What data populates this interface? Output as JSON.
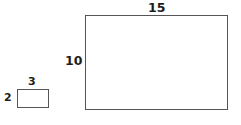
{
  "figure": {
    "type": "geometry-diagram",
    "background_color": "#ffffff",
    "stroke_color": "#555555",
    "text_color": "#1d1d1d",
    "shapes": [
      {
        "name": "small-rectangle",
        "shape": "rectangle",
        "width_label": "3",
        "height_label": "2"
      },
      {
        "name": "large-rectangle",
        "shape": "rectangle",
        "width_label": "15",
        "height_label": "10"
      }
    ]
  },
  "chart_data": {
    "type": "table",
    "title": "",
    "categories": [
      "small rectangle",
      "large rectangle"
    ],
    "series": [
      {
        "name": "width",
        "values": [
          3,
          15
        ]
      },
      {
        "name": "height",
        "values": [
          2,
          10
        ]
      }
    ],
    "annotations": [
      "3",
      "2",
      "15",
      "10"
    ]
  }
}
